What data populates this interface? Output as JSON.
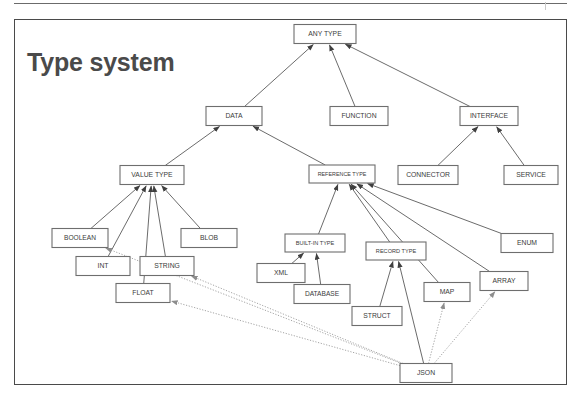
{
  "slide": {
    "title": "Type system"
  },
  "diagram": {
    "type": "class-hierarchy",
    "nodes": [
      {
        "id": "any_type",
        "label": "ANY TYPE",
        "x": 325,
        "y": 34,
        "w": 62,
        "h": 19,
        "font": 6.8
      },
      {
        "id": "data",
        "label": "DATA",
        "x": 234,
        "y": 116,
        "w": 56,
        "h": 19,
        "font": 6.8
      },
      {
        "id": "function",
        "label": "FUNCTION",
        "x": 359,
        "y": 116,
        "w": 58,
        "h": 19,
        "font": 6.8
      },
      {
        "id": "interface",
        "label": "INTERFACE",
        "x": 489,
        "y": 116,
        "w": 58,
        "h": 19,
        "font": 6.8
      },
      {
        "id": "value_type",
        "label": "VALUE TYPE",
        "x": 152,
        "y": 175,
        "w": 64,
        "h": 19,
        "font": 6.8
      },
      {
        "id": "reference_type",
        "label": "REFERENCE TYPE",
        "x": 342,
        "y": 174,
        "w": 66,
        "h": 18,
        "font": 5.4
      },
      {
        "id": "connector",
        "label": "CONNECTOR",
        "x": 428,
        "y": 175,
        "w": 60,
        "h": 19,
        "font": 6.8
      },
      {
        "id": "service",
        "label": "SERVICE",
        "x": 531,
        "y": 175,
        "w": 54,
        "h": 19,
        "font": 6.8
      },
      {
        "id": "boolean",
        "label": "BOOLEAN",
        "x": 80,
        "y": 238,
        "w": 56,
        "h": 19,
        "font": 6.6
      },
      {
        "id": "blob",
        "label": "BLOB",
        "x": 209,
        "y": 238,
        "w": 56,
        "h": 19,
        "font": 6.8
      },
      {
        "id": "built_in_type",
        "label": "BUILT-IN TYPE",
        "x": 315,
        "y": 243,
        "w": 60,
        "h": 18,
        "font": 5.6
      },
      {
        "id": "record_type",
        "label": "RECORD TYPE",
        "x": 396,
        "y": 251,
        "w": 60,
        "h": 18,
        "font": 5.6
      },
      {
        "id": "enum",
        "label": "ENUM",
        "x": 527,
        "y": 243,
        "w": 52,
        "h": 19,
        "font": 6.8
      },
      {
        "id": "int",
        "label": "INT",
        "x": 103,
        "y": 266,
        "w": 54,
        "h": 19,
        "font": 6.8
      },
      {
        "id": "string",
        "label": "STRING",
        "x": 167,
        "y": 266,
        "w": 54,
        "h": 19,
        "font": 6.8
      },
      {
        "id": "xml",
        "label": "XML",
        "x": 281,
        "y": 273,
        "w": 48,
        "h": 19,
        "font": 6.8
      },
      {
        "id": "map",
        "label": "MAP",
        "x": 447,
        "y": 292,
        "w": 46,
        "h": 19,
        "font": 6.8
      },
      {
        "id": "array",
        "label": "ARRAY",
        "x": 504,
        "y": 281,
        "w": 48,
        "h": 19,
        "font": 6.8
      },
      {
        "id": "float",
        "label": "FLOAT",
        "x": 143,
        "y": 293,
        "w": 54,
        "h": 19,
        "font": 6.8
      },
      {
        "id": "database",
        "label": "DATABASE",
        "x": 322,
        "y": 294,
        "w": 56,
        "h": 19,
        "font": 6.6
      },
      {
        "id": "struct",
        "label": "STRUCT",
        "x": 377,
        "y": 316,
        "w": 50,
        "h": 19,
        "font": 6.8
      },
      {
        "id": "json",
        "label": "JSON",
        "x": 426,
        "y": 373,
        "w": 52,
        "h": 19,
        "font": 6.8
      }
    ],
    "edges": [
      {
        "from": "data",
        "to": "any_type",
        "style": "solid"
      },
      {
        "from": "function",
        "to": "any_type",
        "style": "solid"
      },
      {
        "from": "interface",
        "to": "any_type",
        "style": "solid"
      },
      {
        "from": "value_type",
        "to": "data",
        "style": "solid"
      },
      {
        "from": "reference_type",
        "to": "data",
        "style": "solid"
      },
      {
        "from": "connector",
        "to": "interface",
        "style": "solid"
      },
      {
        "from": "service",
        "to": "interface",
        "style": "solid"
      },
      {
        "from": "boolean",
        "to": "value_type",
        "style": "solid"
      },
      {
        "from": "int",
        "to": "value_type",
        "style": "solid"
      },
      {
        "from": "float",
        "to": "value_type",
        "style": "solid"
      },
      {
        "from": "string",
        "to": "value_type",
        "style": "solid"
      },
      {
        "from": "blob",
        "to": "value_type",
        "style": "solid"
      },
      {
        "from": "built_in_type",
        "to": "reference_type",
        "style": "solid"
      },
      {
        "from": "record_type",
        "to": "reference_type",
        "style": "solid"
      },
      {
        "from": "map",
        "to": "reference_type",
        "style": "solid"
      },
      {
        "from": "array",
        "to": "reference_type",
        "style": "solid"
      },
      {
        "from": "enum",
        "to": "reference_type",
        "style": "solid"
      },
      {
        "from": "xml",
        "to": "built_in_type",
        "style": "solid"
      },
      {
        "from": "database",
        "to": "built_in_type",
        "style": "solid"
      },
      {
        "from": "struct",
        "to": "record_type",
        "style": "solid"
      },
      {
        "from": "json",
        "to": "record_type",
        "style": "solid"
      },
      {
        "from": "json",
        "to": "array",
        "style": "dotted"
      },
      {
        "from": "json",
        "to": "map",
        "style": "dotted"
      },
      {
        "from": "json",
        "to": "string",
        "style": "dotted"
      },
      {
        "from": "json",
        "to": "float",
        "style": "dotted"
      },
      {
        "from": "json",
        "to": "boolean",
        "style": "dotted"
      }
    ]
  }
}
